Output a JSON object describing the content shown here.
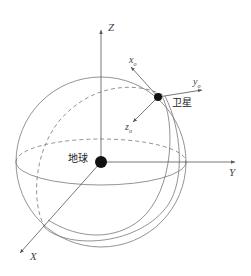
{
  "diagram": {
    "type": "orbit-coordinate-frames",
    "labels": {
      "axis_z": "Z",
      "axis_y": "Y",
      "axis_x": "X",
      "sat_x": "x",
      "sat_x_sub": "o",
      "sat_y": "y",
      "sat_y_sub": "o",
      "sat_z": "z",
      "sat_z_sub": "o",
      "earth": "地球",
      "satellite": "卫星"
    },
    "colors": {
      "line": "#666666",
      "body": "#111111"
    }
  }
}
